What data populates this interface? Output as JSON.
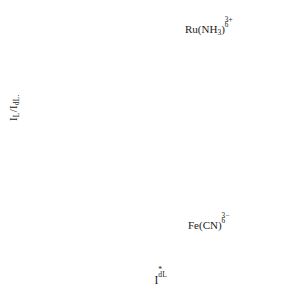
{
  "figure": {
    "background_color": "#ffffff",
    "frame_color": "#2b2b2b",
    "marker_color": "#000000",
    "axis_title_y": "I_L / I_dL.",
    "axis_title_x": "I*_dL"
  },
  "axis_labels": {
    "y_main": "I",
    "y_sub1": "L",
    "y_slash": "/I",
    "y_sub2": "dL.",
    "x_main": "I",
    "x_sub": "dL",
    "x_sup": "*"
  },
  "chart_data": [
    {
      "type": "scatter",
      "panel": "top",
      "title": "",
      "series_label": "Ru(NH3)6 3+",
      "label_parts": {
        "lead": "Ru(NH",
        "sub_inner": "3",
        "mid": ")",
        "sup": "3+",
        "sub_outer": "6"
      },
      "xlabel": "I*_dL",
      "ylabel": "I_L / I_dL.",
      "xscale": "log",
      "xlim": [
        0.005,
        1.6
      ],
      "ylim": [
        1.0,
        2.08
      ],
      "yticks": [
        "2.0",
        "1.6",
        "1.2"
      ],
      "ytick_values": [
        2.0,
        1.6,
        1.2
      ],
      "grid": false,
      "reference_line": {
        "type": "horizontal-dotted",
        "value": 1.13
      },
      "x": [
        0.0088,
        0.0113,
        0.0138,
        0.0165,
        0.0205,
        0.0215,
        0.0225,
        0.0345,
        0.0385,
        0.0405,
        0.0455,
        0.047,
        0.049,
        0.058,
        0.065,
        0.072,
        0.082,
        0.09,
        0.098,
        0.105,
        0.115,
        0.125,
        0.138,
        0.148,
        0.16,
        0.185,
        0.215,
        0.235,
        0.255,
        0.43,
        0.6,
        0.74,
        1.0
      ],
      "y": [
        1.805,
        1.742,
        1.712,
        1.71,
        1.37,
        1.4,
        1.398,
        1.198,
        1.185,
        1.205,
        1.172,
        1.308,
        1.092,
        1.128,
        1.13,
        1.125,
        1.118,
        1.14,
        1.138,
        1.13,
        1.128,
        1.132,
        1.125,
        1.118,
        1.135,
        1.12,
        1.145,
        1.148,
        1.13,
        1.135,
        1.13,
        1.132,
        1.105
      ]
    },
    {
      "type": "scatter",
      "panel": "bottom",
      "title": "",
      "series_label": "Fe(CN)6 3-",
      "label_parts": {
        "lead": "Fe(CN)",
        "sup": "3−",
        "sub_outer": "6"
      },
      "xlabel": "I*_dL",
      "ylabel": "I_L / I_dL.",
      "xscale": "log",
      "xlim": [
        0.005,
        1.6
      ],
      "ylim": [
        0.0,
        1.0
      ],
      "yticks": [
        "0.9",
        "0.6",
        "0.3",
        "0.0"
      ],
      "ytick_values": [
        0.9,
        0.6,
        0.3,
        0.0
      ],
      "grid": false,
      "reference_line": {
        "type": "horizontal-dotted",
        "value": 0.848
      },
      "x": [
        0.0113,
        0.02,
        0.023,
        0.04,
        0.047,
        0.062,
        0.068,
        0.083,
        0.088,
        0.096,
        0.109,
        0.13,
        0.155,
        0.195,
        0.275,
        0.45,
        0.66,
        0.88
      ],
      "y": [
        0.172,
        0.228,
        0.315,
        0.398,
        0.425,
        0.43,
        0.528,
        0.512,
        0.555,
        0.568,
        0.65,
        0.725,
        0.772,
        0.8,
        0.82,
        0.822,
        0.84,
        0.848
      ]
    }
  ],
  "xticks": {
    "labels": [
      "0.01",
      "0.1",
      "1"
    ],
    "values": [
      0.01,
      0.1,
      1
    ]
  }
}
